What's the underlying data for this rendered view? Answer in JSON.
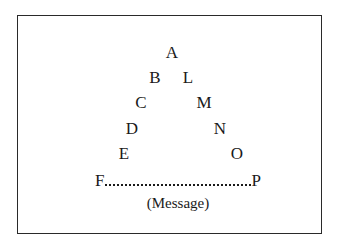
{
  "diagram": {
    "type": "letter-pyramid",
    "apex": "A",
    "left_side": [
      "B",
      "C",
      "D",
      "E",
      "F"
    ],
    "right_side": [
      "L",
      "M",
      "N",
      "O",
      "P"
    ],
    "base": {
      "from": "F",
      "to": "P",
      "style": "dotted-line",
      "label": "(Message)"
    },
    "letters": {
      "A": "A",
      "B": "B",
      "C": "C",
      "D": "D",
      "E": "E",
      "F": "F",
      "L": "L",
      "M": "M",
      "N": "N",
      "O": "O",
      "P": "P"
    },
    "caption": "(Message)"
  }
}
